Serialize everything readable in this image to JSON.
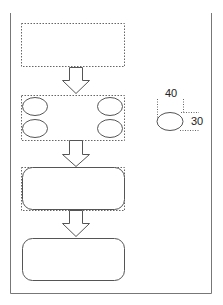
{
  "diagram": {
    "colors": {
      "stroke": "#555555",
      "dotted": "#666666",
      "frame": "#777777",
      "background": "#ffffff"
    },
    "steps": [
      {
        "id": "step-1",
        "shape": "rectangle",
        "style": "dotted-selection"
      },
      {
        "id": "step-2",
        "shape": "group-of-4-ellipses",
        "style": "dotted-selection"
      },
      {
        "id": "step-3",
        "shape": "rounded-rectangle",
        "style": "selected-with-dotted-bbox"
      },
      {
        "id": "step-4",
        "shape": "rounded-rectangle",
        "style": "solid"
      }
    ],
    "arrows": [
      {
        "from": "step-1",
        "to": "step-2",
        "direction": "down"
      },
      {
        "from": "step-2",
        "to": "step-3",
        "direction": "down"
      },
      {
        "from": "step-3",
        "to": "step-4",
        "direction": "down"
      }
    ],
    "annotation": {
      "shape": "ellipse",
      "width_label": "40",
      "height_label": "30"
    }
  }
}
